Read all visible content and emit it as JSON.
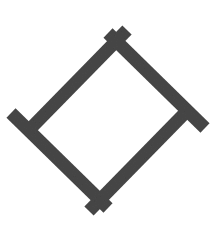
{
  "figure": {
    "title": "Figure B",
    "background_color": "#ffffff",
    "canvas": {
      "width": 216,
      "height": 241
    }
  },
  "chart_data": {
    "type": "diagram",
    "title": "Figure B",
    "xlabel": "",
    "ylabel": "",
    "shape": "rotated-square-outline",
    "bar_count": 4,
    "bar_color": "#474747",
    "bar_thickness_px": 13,
    "bar_length_px": 138,
    "arrangement": "pinwheel",
    "series": [
      {
        "name": "bars",
        "values": [
          {
            "id": "bar-upper-right",
            "label": "upper right bar",
            "x1": 108,
            "y1": 33,
            "x2": 205,
            "y2": 128,
            "angle_deg": 44,
            "color": "#474747"
          },
          {
            "id": "bar-lower-right",
            "label": "lower right bar",
            "x1": 184,
            "y1": 114,
            "x2": 89,
            "y2": 211,
            "angle_deg": 134,
            "color": "#474747"
          },
          {
            "id": "bar-lower-left",
            "label": "lower left bar",
            "x1": 108,
            "y1": 208,
            "x2": 11,
            "y2": 113,
            "angle_deg": 224,
            "color": "#474747"
          },
          {
            "id": "bar-upper-left",
            "label": "upper left bar",
            "x1": 32,
            "y1": 127,
            "x2": 127,
            "y2": 30,
            "angle_deg": 314,
            "color": "#474747"
          }
        ]
      }
    ],
    "legend": [],
    "annotations": [],
    "grid": false
  }
}
